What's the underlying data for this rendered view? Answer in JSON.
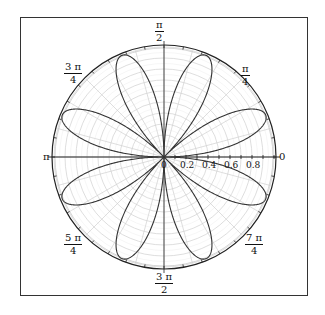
{
  "chart_data": {
    "type": "polar-line",
    "title": "",
    "function": "r = sin(4θ)",
    "petals": 8,
    "r_range": [
      0,
      1
    ],
    "radial_ticks": [
      "0",
      "0.2",
      "0.4",
      "0.6",
      "0.8"
    ],
    "angular_labels": [
      {
        "angle_deg": 0,
        "num": "0",
        "den": ""
      },
      {
        "angle_deg": 45,
        "num": "π",
        "den": "4"
      },
      {
        "angle_deg": 90,
        "num": "π",
        "den": "2"
      },
      {
        "angle_deg": 135,
        "num": "3 π",
        "den": "4"
      },
      {
        "angle_deg": 180,
        "num": "π",
        "den": ""
      },
      {
        "angle_deg": 225,
        "num": "5 π",
        "den": "4"
      },
      {
        "angle_deg": 270,
        "num": "3 π",
        "den": "2"
      },
      {
        "angle_deg": 315,
        "num": "7 π",
        "den": "4"
      }
    ],
    "grid": {
      "circles_step": 0.1,
      "radial_step_deg": 15
    },
    "colors": {
      "curve": "#333333",
      "grid": "#d0d0d0",
      "axis": "#222222",
      "frame": "#333333"
    }
  },
  "labels": {
    "a0": "0",
    "a45_num": "π",
    "a45_den": "4",
    "a90_num": "π",
    "a90_den": "2",
    "a135_num": "3 π",
    "a135_den": "4",
    "a180": "π",
    "a225_num": "5 π",
    "a225_den": "4",
    "a270_num": "3 π",
    "a270_den": "2",
    "a315_num": "7 π",
    "a315_den": "4",
    "r0": "0",
    "r02": "0.2",
    "r04": "0.4",
    "r06": "0.6",
    "r08": "0.8"
  }
}
